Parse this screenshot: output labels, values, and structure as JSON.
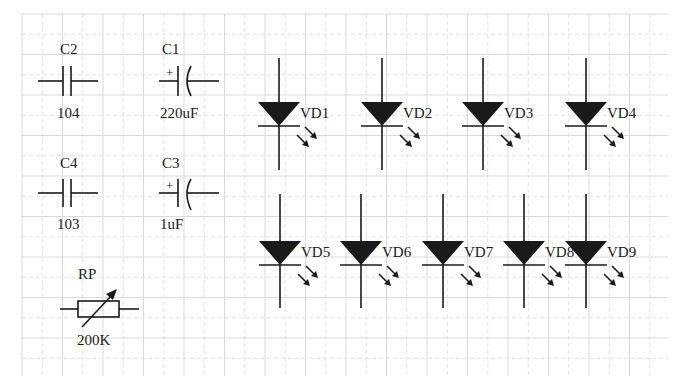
{
  "schematic": {
    "background": "#ffffff",
    "ink_color": "#1a1a1a",
    "grid": {
      "x0": 22,
      "x1": 668,
      "y0": 14,
      "y1": 376,
      "major_spacing": 40.5,
      "minor_spacing": 20.25
    },
    "capacitors": [
      {
        "ref": "C2",
        "value": "104",
        "type": "ceramic",
        "polarized": false,
        "cx": 80,
        "cy": 81
      },
      {
        "ref": "C1",
        "value": "220uF",
        "type": "electrolytic",
        "polarized": true,
        "plus": "+",
        "cx": 180,
        "cy": 81
      },
      {
        "ref": "C4",
        "value": "103",
        "type": "ceramic",
        "polarized": false,
        "cx": 80,
        "cy": 193
      },
      {
        "ref": "C3",
        "value": "1uF",
        "type": "electrolytic",
        "polarized": true,
        "plus": "+",
        "cx": 180,
        "cy": 193
      }
    ],
    "potentiometer": {
      "ref": "RP",
      "value": "200K",
      "cx": 99,
      "cy": 309
    },
    "leds": [
      {
        "ref": "VD1",
        "x": 279,
        "row": "top"
      },
      {
        "ref": "VD2",
        "x": 382,
        "row": "top"
      },
      {
        "ref": "VD3",
        "x": 483,
        "row": "top"
      },
      {
        "ref": "VD4",
        "x": 586,
        "row": "top"
      },
      {
        "ref": "VD5",
        "x": 280,
        "row": "bottom"
      },
      {
        "ref": "VD6",
        "x": 361,
        "row": "bottom"
      },
      {
        "ref": "VD7",
        "x": 443,
        "row": "bottom"
      },
      {
        "ref": "VD8",
        "x": 524,
        "row": "bottom"
      },
      {
        "ref": "VD9",
        "x": 586,
        "row": "bottom"
      }
    ],
    "rows": {
      "top": {
        "y_start": 58,
        "tri_top": 102,
        "bar_y": 126,
        "y_end": 170
      },
      "bottom": {
        "y_start": 194,
        "tri_top": 241,
        "bar_y": 265,
        "y_end": 308
      }
    }
  }
}
